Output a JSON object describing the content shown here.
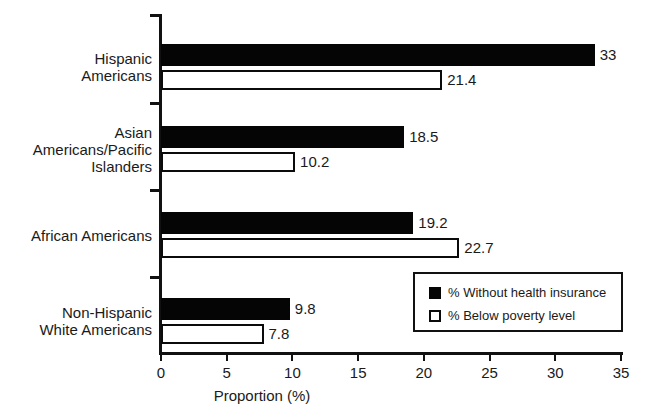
{
  "chart_data": {
    "type": "bar",
    "orientation": "horizontal",
    "title": "",
    "xlabel": "Proportion (%)",
    "ylabel": "",
    "xlim": [
      0,
      35
    ],
    "xticks": [
      0,
      5,
      10,
      15,
      20,
      25,
      30,
      35
    ],
    "xtick_labels": [
      "0",
      "5",
      "10",
      "15",
      "20",
      "25",
      "30",
      "35"
    ],
    "grid": false,
    "legend_position": "lower-right",
    "categories": [
      "Hispanic\nAmericans",
      "Asian\nAmericans/Pacific\nIslanders",
      "African Americans",
      "Non-Hispanic\nWhite Americans"
    ],
    "series": [
      {
        "name": "% Without health insurance",
        "style": "filled",
        "color": "#050505",
        "values": [
          33,
          18.5,
          19.2,
          9.8
        ],
        "value_labels": [
          "33",
          "18.5",
          "19.2",
          "9.8"
        ]
      },
      {
        "name": "% Below poverty level",
        "style": "hollow",
        "color": "#ffffff",
        "values": [
          21.4,
          10.2,
          22.7,
          7.8
        ],
        "value_labels": [
          "21.4",
          "10.2",
          "22.7",
          "7.8"
        ]
      }
    ]
  },
  "legend": {
    "items": [
      {
        "label": "% Without health insurance",
        "style": "filled"
      },
      {
        "label": "% Below poverty level",
        "style": "hollow"
      }
    ]
  },
  "axis": {
    "x_title": "Proportion (%)"
  }
}
